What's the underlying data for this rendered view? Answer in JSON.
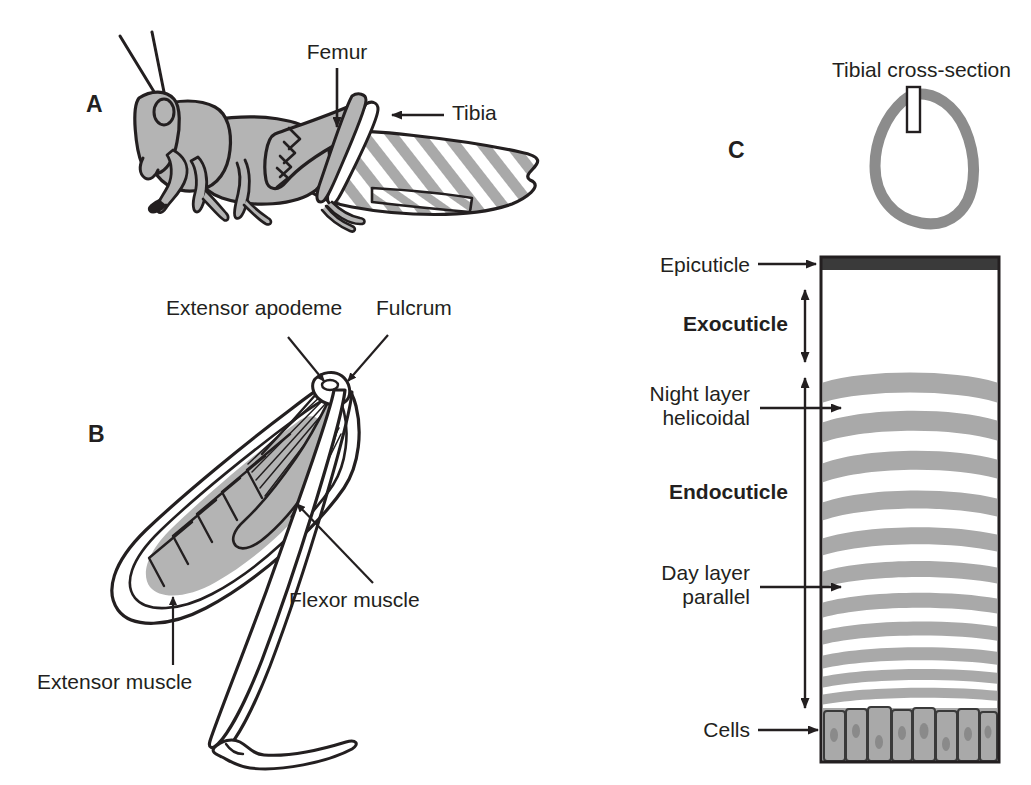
{
  "figure": {
    "background_color": "#ffffff",
    "ink_color": "#231f20",
    "body_fill": "#b4b4b4",
    "band_fill": "#a9a9a9",
    "epicuticle_fill": "#3a3a3a",
    "cell_fill": "#a9a9a9",
    "cross_section_stroke": "#8c8c8c"
  },
  "panels": [
    {
      "id": "A",
      "letter": "A",
      "name": "grasshopper-whole-body",
      "labels": [
        {
          "key": "femur",
          "text": "Femur",
          "name": "label-femur"
        },
        {
          "key": "tibia",
          "text": "Tibia",
          "name": "label-tibia"
        }
      ]
    },
    {
      "id": "B",
      "letter": "B",
      "name": "hind-leg-muscles",
      "labels": [
        {
          "key": "extensor_apodeme",
          "text": "Extensor apodeme",
          "name": "label-extensor-apodeme"
        },
        {
          "key": "fulcrum",
          "text": "Fulcrum",
          "name": "label-fulcrum"
        },
        {
          "key": "flexor_muscle",
          "text": "Flexor muscle",
          "name": "label-flexor-muscle"
        },
        {
          "key": "extensor_muscle",
          "text": "Extensor muscle",
          "name": "label-extensor-muscle"
        }
      ]
    },
    {
      "id": "C",
      "letter": "C",
      "name": "tibial-cuticle-section",
      "labels": [
        {
          "key": "tibial_cross_section",
          "text": "Tibial cross-section",
          "name": "label-tibial-cross-section"
        },
        {
          "key": "epicuticle",
          "text": "Epicuticle",
          "name": "label-epicuticle"
        },
        {
          "key": "exocuticle",
          "text": "Exocuticle",
          "name": "label-exocuticle"
        },
        {
          "key": "night_layer_line1",
          "text": "Night layer",
          "name": "label-night-layer-line1"
        },
        {
          "key": "night_layer_line2",
          "text": "helicoidal",
          "name": "label-night-layer-line2"
        },
        {
          "key": "endocuticle",
          "text": "Endocuticle",
          "name": "label-endocuticle"
        },
        {
          "key": "day_layer_line1",
          "text": "Day layer",
          "name": "label-day-layer-line1"
        },
        {
          "key": "day_layer_line2",
          "text": "parallel",
          "name": "label-day-layer-parallel-line2"
        },
        {
          "key": "cells",
          "text": "Cells",
          "name": "label-cells"
        }
      ]
    }
  ],
  "panel_a": {
    "letter": "A",
    "femur": "Femur",
    "tibia": "Tibia"
  },
  "panel_b": {
    "letter": "B",
    "extensor_apodeme": "Extensor apodeme",
    "fulcrum": "Fulcrum",
    "flexor_muscle": "Flexor muscle",
    "extensor_muscle": "Extensor muscle"
  },
  "panel_c": {
    "letter": "C",
    "tibial_cross_section": "Tibial cross-section",
    "epicuticle": "Epicuticle",
    "exocuticle": "Exocuticle",
    "night_layer_line1": "Night layer",
    "night_layer_line2": "helicoidal",
    "endocuticle": "Endocuticle",
    "day_layer_line1": "Day layer",
    "day_layer_line2": "parallel",
    "cells": "Cells"
  },
  "cuticle_block": {
    "left_px": 821,
    "right_px": 999,
    "top_px": 257,
    "bottom_px": 762,
    "epicuticle_band": {
      "top_px": 257,
      "bottom_px": 269
    },
    "exocuticle_span": {
      "top_px": 290,
      "bottom_px": 362
    },
    "endocuticle_span": {
      "top_px": 378,
      "bottom_px": 708
    },
    "cells_row": {
      "top_px": 708,
      "bottom_px": 762,
      "count": 8
    },
    "band_count": 17,
    "band_note": "Alternating gray (night helicoidal) and white (day parallel) growth layers, thinning toward the epidermis"
  }
}
